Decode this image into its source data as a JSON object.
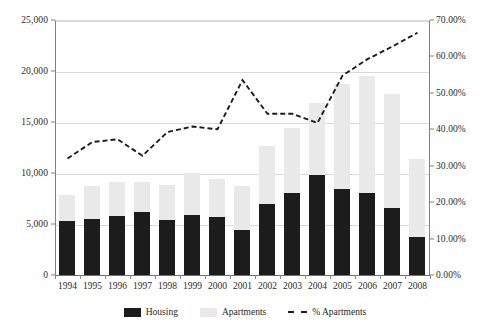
{
  "chart_data": {
    "type": "bar",
    "title": "",
    "subtitle": "",
    "xlabel": "",
    "ylabel": "",
    "y2label": "",
    "grid": true,
    "legend_position": "bottom",
    "categories": [
      "1994",
      "1995",
      "1996",
      "1997",
      "1998",
      "1999",
      "2000",
      "2001",
      "2002",
      "2003",
      "2004",
      "2005",
      "2006",
      "2007",
      "2008"
    ],
    "ylim": [
      0,
      25000
    ],
    "yticks": [
      "0",
      "5,000",
      "10,000",
      "15,000",
      "20,000",
      "25,000"
    ],
    "ytick_values": [
      0,
      5000,
      10000,
      15000,
      20000,
      25000
    ],
    "y2lim": [
      0,
      0.7
    ],
    "y2ticks": [
      "0.00%",
      "10.00%",
      "20.00%",
      "30.00%",
      "40.00%",
      "50.00%",
      "60.00%",
      "70.00%"
    ],
    "y2tick_values": [
      0,
      0.1,
      0.2,
      0.3,
      0.4,
      0.5,
      0.6,
      0.7
    ],
    "stacked": true,
    "series": [
      {
        "name": "Housing",
        "type": "bar",
        "axis": "left",
        "color": "#1c1c1c",
        "values": [
          5300,
          5500,
          5800,
          6200,
          5400,
          5850,
          5650,
          4400,
          7000,
          8050,
          9800,
          8450,
          8000,
          6600,
          3750
        ]
      },
      {
        "name": "Apartments",
        "type": "bar",
        "axis": "left",
        "color": "#e9e9e9",
        "values": [
          2500,
          3200,
          3350,
          2900,
          3450,
          4200,
          3800,
          4350,
          5650,
          6400,
          7050,
          10300,
          11500,
          11100,
          7600
        ]
      },
      {
        "name": "% Apartments",
        "type": "line",
        "axis": "right",
        "color": "#1c1c1c",
        "style": "dashed",
        "values": [
          0.32,
          0.365,
          0.3725,
          0.3275,
          0.3925,
          0.4075,
          0.4,
          0.535,
          0.4425,
          0.4425,
          0.4175,
          0.5475,
          0.5925,
          0.6275,
          0.665
        ]
      }
    ],
    "legend": [
      {
        "label": "Housing",
        "marker": "square-dark"
      },
      {
        "label": "Apartments",
        "marker": "square-light"
      },
      {
        "label": "% Apartments",
        "marker": "dashed-line"
      }
    ]
  }
}
